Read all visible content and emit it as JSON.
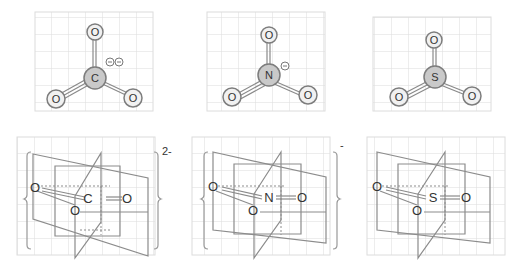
{
  "panels": [
    {
      "id": "carbonate",
      "central_atom": "C",
      "ligands": [
        "O",
        "O",
        "O"
      ],
      "formal_charges": [
        "⊖",
        "⊖"
      ],
      "overall_charge": "2-",
      "has_brackets": true
    },
    {
      "id": "nitrate",
      "central_atom": "N",
      "ligands": [
        "O",
        "O",
        "O"
      ],
      "formal_charges": [
        "⊖"
      ],
      "overall_charge": "-",
      "has_brackets": true
    },
    {
      "id": "sulfur-trioxide",
      "central_atom": "S",
      "ligands": [
        "O",
        "O",
        "O"
      ],
      "formal_charges": [],
      "overall_charge": "",
      "has_brackets": false
    }
  ],
  "colors": {
    "grid": "#dcdcdc",
    "bond": "#8a8a8a",
    "central_atom_fill": "#c9c9c9",
    "ligand_atom_fill": "#f1f1f1",
    "plane_stroke": "#8c8c8c"
  }
}
